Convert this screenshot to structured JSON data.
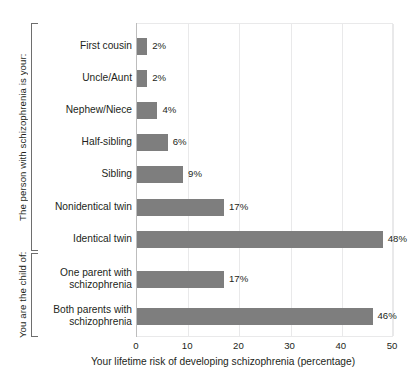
{
  "chart_data": {
    "type": "bar",
    "orientation": "horizontal",
    "title": "",
    "xlabel": "Your lifetime risk of developing schizophrenia (percentage)",
    "ylabel": "",
    "xlim": [
      0,
      50.4
    ],
    "xticks": [
      0,
      10,
      20,
      30,
      40,
      50
    ],
    "xtick_labels": [
      "0",
      "10",
      "20",
      "30",
      "40",
      "50"
    ],
    "grid": true,
    "legend": false,
    "bar_color": "#7e7e7e",
    "categories": [
      "First cousin",
      "Uncle/Aunt",
      "Nephew/Niece",
      "Half-sibling",
      "Sibling",
      "Nonidentical twin",
      "Identical twin",
      "One parent with\nschizophrenia",
      "Both parents with\nschizophrenia"
    ],
    "values": [
      2,
      2,
      4,
      6,
      9,
      17,
      48,
      17,
      46
    ],
    "value_labels": [
      "2%",
      "2%",
      "4%",
      "6%",
      "9%",
      "17%",
      "48%",
      "17%",
      "46%"
    ],
    "groups": [
      {
        "label": "The person with schizophrenia is your:",
        "start_index": 0,
        "end_index": 6
      },
      {
        "label": "You are the child of:",
        "start_index": 7,
        "end_index": 8
      }
    ]
  }
}
